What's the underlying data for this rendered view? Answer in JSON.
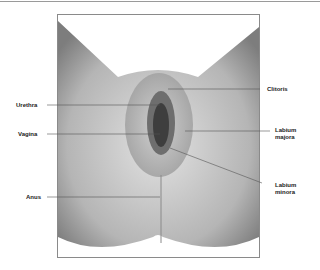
{
  "diagram": {
    "type": "anatomical-labeled-illustration",
    "labels": [
      {
        "id": "clitoris",
        "text": "Clitoris",
        "side": "right"
      },
      {
        "id": "urethra",
        "text": "Urethra",
        "side": "left"
      },
      {
        "id": "vagina",
        "text": "Vagina",
        "side": "left"
      },
      {
        "id": "labium_majora",
        "line1": "Labium",
        "line2": "majora",
        "side": "right"
      },
      {
        "id": "labium_minora",
        "line1": "Labium",
        "line2": "minora",
        "side": "right"
      },
      {
        "id": "anus",
        "text": "Anus",
        "side": "left"
      }
    ],
    "colors": {
      "frame": "#8a8a8a",
      "skin_light": "#d8d8d8",
      "skin_dark": "#7a7a7a",
      "leader": "#555555",
      "text": "#222222"
    }
  }
}
